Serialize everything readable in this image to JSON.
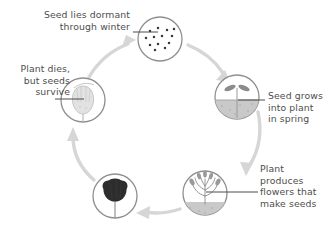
{
  "diagram": {
    "type": "cycle-diagram",
    "direction": "clockwise",
    "colors": {
      "text": "#4d4d4d",
      "ring": "#8f8f8f",
      "cycle_arrow": "#d3d3d3",
      "leader_line": "#4d4d4d",
      "soil": "#c9c9c9",
      "seed_dot": "#3a3a3a",
      "seed_head": "#2e2e2e",
      "background": "#ffffff"
    },
    "stages": [
      {
        "id": "dormant",
        "label": "Seed lies dormant\nthrough winter",
        "icon": "seeds-scattered-icon",
        "position": "top"
      },
      {
        "id": "grows",
        "label": "Seed grows\ninto plant\nin spring",
        "icon": "seedling-sprouting-icon",
        "position": "right"
      },
      {
        "id": "flowers",
        "label": "Plant produces\nflowers that\nmake seeds",
        "icon": "flowering-plant-icon",
        "position": "bottom-right"
      },
      {
        "id": "seedhead",
        "label": "",
        "icon": "seed-head-icon",
        "position": "bottom-left"
      },
      {
        "id": "dies",
        "label": "Plant dies,\nbut seeds\nsurvive",
        "icon": "dried-seed-pod-icon",
        "position": "left"
      }
    ],
    "arrows": [
      {
        "id": "arrow-to-dormant",
        "from": "dies",
        "to": "dormant",
        "direction": "up-right"
      },
      {
        "id": "arrow-to-grows",
        "from": "dormant",
        "to": "grows",
        "direction": "down-right"
      },
      {
        "id": "arrow-to-flowers",
        "from": "grows",
        "to": "flowers",
        "direction": "down"
      },
      {
        "id": "arrow-to-seedhead",
        "from": "flowers",
        "to": "seedhead",
        "direction": "left"
      },
      {
        "id": "arrow-to-dies",
        "from": "seedhead",
        "to": "dies",
        "direction": "up"
      }
    ]
  }
}
